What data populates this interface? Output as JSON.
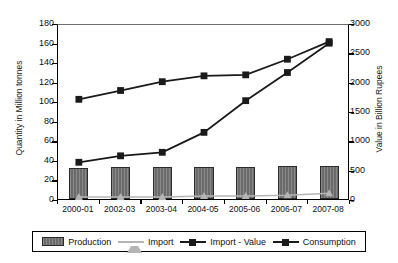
{
  "chart_data": {
    "type": "bar",
    "title": "",
    "subtitle": "",
    "xlabel": "",
    "ylabel": "Quantity in Million tonnes",
    "y2label": "Value in Billion Rupees",
    "categories": [
      "2000-01",
      "2002-03",
      "2003-04",
      "2004-05",
      "2005-06",
      "2006-07",
      "2007-08"
    ],
    "ylim": [
      0,
      180
    ],
    "yticks": [
      0,
      20,
      40,
      60,
      80,
      100,
      120,
      140,
      160,
      180
    ],
    "y2lim": [
      0,
      3000
    ],
    "y2ticks": [
      0,
      500,
      1000,
      1500,
      2000,
      2500,
      3000
    ],
    "grid": false,
    "legend_position": "bottom",
    "series": [
      {
        "name": "Production",
        "kind": "bar",
        "axis": "left",
        "unit": "Million tonnes",
        "color": "#6b6b6b",
        "values": [
          32,
          33,
          33,
          33,
          33,
          34,
          34
        ]
      },
      {
        "name": "Import",
        "kind": "line",
        "marker": "triangle",
        "axis": "left",
        "unit": "Million tonnes",
        "color": "#b5b5b5",
        "values": [
          4,
          4,
          4,
          5,
          5,
          6,
          8
        ]
      },
      {
        "name": "Import - Value",
        "kind": "line",
        "marker": "square",
        "axis": "right",
        "unit": "Billion Rupees",
        "color": "#1a1a1a",
        "values": [
          660,
          770,
          830,
          1170,
          1710,
          2190,
          2690
        ]
      },
      {
        "name": "Consumption",
        "kind": "line",
        "marker": "square",
        "axis": "left",
        "unit": "Million tonnes",
        "color": "#1a1a1a",
        "values": [
          104,
          113,
          122,
          128,
          129,
          145,
          163
        ]
      }
    ]
  },
  "legend": {
    "items": [
      {
        "label": "Production"
      },
      {
        "label": "Import"
      },
      {
        "label": "Import - Value"
      },
      {
        "label": "Consumption"
      }
    ]
  }
}
